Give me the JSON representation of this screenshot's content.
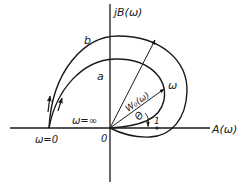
{
  "figure": {
    "type": "Nyquist-like hodograph (frequency response locus)",
    "axes": {
      "vertical_label": "jB(ω)",
      "horizontal_label": "A(ω)",
      "origin_label": "0"
    },
    "curves": [
      {
        "id": "a",
        "label": "a"
      },
      {
        "id": "b",
        "label": "b"
      }
    ],
    "annotations": {
      "start_point": "ω=0",
      "end_point": "ω=∞",
      "frequency_label": "ω",
      "vector_label": "W₀(ω)",
      "angle_label": "Θ",
      "unit_point": "1"
    },
    "colors": {
      "line": "#1a1a1a",
      "background": "#ffffff"
    }
  }
}
